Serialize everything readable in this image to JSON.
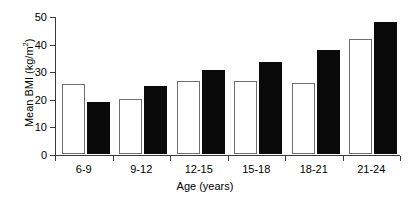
{
  "chart_data": {
    "type": "bar",
    "title": "",
    "subtitle": "",
    "xlabel": "Age (years)",
    "ylabel": "Mean BMI (kg/m²)",
    "ylabel_base": "Mean BMI (kg/m",
    "ylabel_sup": "2",
    "ylabel_close": ")",
    "categories": [
      "6-9",
      "9-12",
      "12-15",
      "15-18",
      "18-21",
      "21-24"
    ],
    "series": [
      {
        "name": "open",
        "style": "open-white-bar",
        "color": "#ffffff",
        "edge_color": "#6e6e6e",
        "values": [
          25.4,
          20.0,
          26.5,
          26.3,
          25.8,
          41.7
        ]
      },
      {
        "name": "filled",
        "style": "solid-black-bar",
        "color": "#0a0a0a",
        "edge_color": "#0a0a0a",
        "values": [
          18.8,
          24.7,
          30.3,
          33.5,
          37.8,
          48.0
        ]
      }
    ],
    "ylim": [
      0,
      50
    ],
    "yticks": [
      0,
      10,
      20,
      30,
      40,
      50
    ],
    "ytick_labels": [
      "0",
      "10",
      "20",
      "30",
      "40",
      "50"
    ],
    "grid": false,
    "legend": "none",
    "legend_position": "none",
    "axis_color": "#3b3b3b",
    "background": "#ffffff"
  }
}
